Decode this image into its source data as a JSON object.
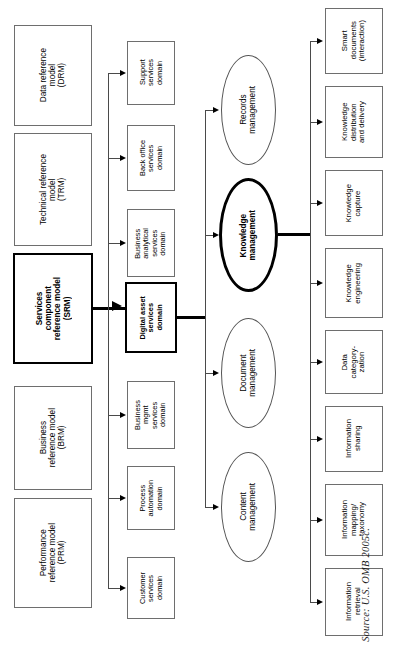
{
  "figure": {
    "source_note": "Source: U.S. OMB 2005c."
  },
  "colors": {
    "node_border": "#6e6e6e",
    "emphasis_border": "#000000",
    "connector": "#4a4a4a",
    "background": "#ffffff"
  },
  "columns": {
    "reference_models": {
      "name": "FEA reference models",
      "nodes": [
        {
          "id": "drm",
          "label": "Data reference\nmodel\n(DRM)",
          "emphasis": false,
          "x": 14,
          "y": 25,
          "w": 78,
          "h": 101
        },
        {
          "id": "trm",
          "label": "Technical reference\nmodel\n(TRM)",
          "emphasis": false,
          "x": 14,
          "y": 133,
          "w": 78,
          "h": 113
        },
        {
          "id": "srm",
          "label": "Services\ncomponent\nreference model\n(SRM)",
          "emphasis": true,
          "x": 13,
          "y": 253,
          "w": 80,
          "h": 111
        },
        {
          "id": "brm",
          "label": "Business\nreference model\n(BRM)",
          "emphasis": false,
          "x": 14,
          "y": 386,
          "w": 78,
          "h": 104
        },
        {
          "id": "prm",
          "label": "Performance\nreference model\n(PRM)",
          "emphasis": false,
          "x": 14,
          "y": 498,
          "w": 78,
          "h": 110
        }
      ]
    },
    "srm_domains": {
      "name": "SRM service domains",
      "nodes": [
        {
          "id": "support",
          "label": "Support\nservices\ndomain",
          "emphasis": false,
          "x": 127,
          "y": 41,
          "w": 48,
          "h": 64
        },
        {
          "id": "back-office",
          "label": "Back office\nservices\ndomain",
          "emphasis": false,
          "x": 127,
          "y": 125,
          "w": 48,
          "h": 66
        },
        {
          "id": "business-analytical",
          "label": "Business\nanalytical\nservices\ndomain",
          "emphasis": false,
          "x": 127,
          "y": 209,
          "w": 48,
          "h": 68
        },
        {
          "id": "digital-asset",
          "label": "Digital asset\nservices\ndomain",
          "emphasis": true,
          "x": 125,
          "y": 282,
          "w": 52,
          "h": 71
        },
        {
          "id": "business-mgmt",
          "label": "Business\nmgmt\nservices\ndomain",
          "emphasis": false,
          "x": 127,
          "y": 381,
          "w": 48,
          "h": 68
        },
        {
          "id": "process-automation",
          "label": "Process\nautomation\ndomain",
          "emphasis": false,
          "x": 127,
          "y": 466,
          "w": 48,
          "h": 64
        },
        {
          "id": "customer-services",
          "label": "Customer\nservices\ndomain",
          "emphasis": false,
          "x": 127,
          "y": 557,
          "w": 48,
          "h": 62
        }
      ]
    },
    "service_types": {
      "name": "Digital asset service types",
      "nodes": [
        {
          "id": "records-management",
          "label": "Records\nmanagement",
          "emphasis": false,
          "x": 221,
          "y": 55,
          "w": 55,
          "h": 110
        },
        {
          "id": "knowledge-management",
          "label": "Knowledge\nmanagement",
          "emphasis": true,
          "x": 219,
          "y": 178,
          "w": 59,
          "h": 114
        },
        {
          "id": "document-management",
          "label": "Document\nmanagement",
          "emphasis": false,
          "x": 221,
          "y": 318,
          "w": 55,
          "h": 110
        },
        {
          "id": "content-management",
          "label": "Content\nmanagement",
          "emphasis": false,
          "x": 221,
          "y": 452,
          "w": 55,
          "h": 110
        }
      ]
    },
    "knowledge_components": {
      "name": "Knowledge management components",
      "nodes": [
        {
          "id": "smart-documents",
          "label": "Smart\ndocuments\n(interaction)",
          "emphasis": false,
          "x": 325,
          "y": 8,
          "w": 58,
          "h": 66
        },
        {
          "id": "knowledge-distribution",
          "label": "Knowledge\ndistribution\nand delivery",
          "emphasis": false,
          "x": 325,
          "y": 86,
          "w": 58,
          "h": 72
        },
        {
          "id": "knowledge-capture",
          "label": "Knowledge\ncapture",
          "emphasis": false,
          "x": 325,
          "y": 170,
          "w": 58,
          "h": 66
        },
        {
          "id": "knowledge-engineering",
          "label": "Knowledge\nengineering",
          "emphasis": false,
          "x": 325,
          "y": 248,
          "w": 58,
          "h": 70
        },
        {
          "id": "data-categoryzation",
          "label": "Data\ncategory-\nzation",
          "emphasis": false,
          "x": 325,
          "y": 330,
          "w": 58,
          "h": 64
        },
        {
          "id": "information-sharing",
          "label": "Information\nsharing",
          "emphasis": false,
          "x": 325,
          "y": 406,
          "w": 58,
          "h": 66
        },
        {
          "id": "information-mapping",
          "label": "Information\nmapping/\ntaxonomy",
          "emphasis": false,
          "x": 325,
          "y": 484,
          "w": 58,
          "h": 72
        },
        {
          "id": "information-retrieval",
          "label": "Information\nretrieval",
          "emphasis": false,
          "x": 325,
          "y": 568,
          "w": 58,
          "h": 68
        }
      ]
    }
  }
}
